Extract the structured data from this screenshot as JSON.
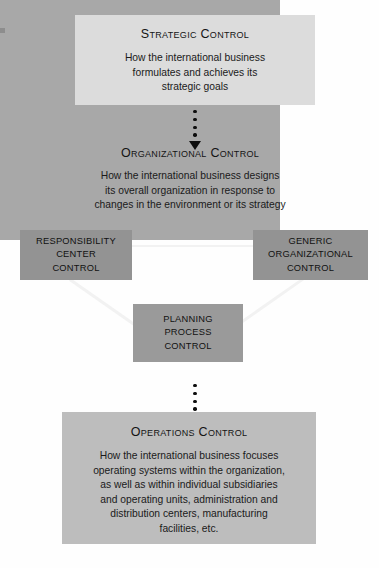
{
  "diagram": {
    "palette": {
      "page_background": "#fefefe",
      "strategic_fill": "#dcdcdc",
      "organizational_fill": "#a8a8a8",
      "subbox_fill": "#939393",
      "planning_fill": "#9a9a9a",
      "operations_fill": "#bdbdbd",
      "connector_line": "#f2f2f2",
      "arrow_color": "#0d0d0d",
      "text_color": "#141414"
    },
    "strategic": {
      "title": "Strategic Control",
      "body_lines": [
        "How the international business",
        "formulates and achieves its",
        "strategic goals"
      ]
    },
    "organizational": {
      "title": "Organizational Control",
      "body_lines": [
        "How the international business designs",
        "its overall organization in response to",
        "changes in the environment or its strategy"
      ],
      "subboxes": [
        {
          "id": "responsibility-center-control",
          "lines": [
            "RESPONSIBILITY",
            "CENTER",
            "CONTROL"
          ]
        },
        {
          "id": "generic-organizational-control",
          "lines": [
            "GENERIC",
            "ORGANIZATIONAL",
            "CONTROL"
          ]
        },
        {
          "id": "planning-process-control",
          "lines": [
            "PLANNING",
            "PROCESS",
            "CONTROL"
          ]
        }
      ]
    },
    "operations": {
      "title": "Operations Control",
      "body_lines": [
        "How the international business focuses",
        "operating systems within the organization,",
        "as well as within individual subsidiaries",
        "and operating units, administration and",
        "distribution centers, manufacturing",
        "facilities, etc."
      ]
    },
    "arrows": [
      {
        "id": "strategic-to-organizational",
        "style": "dotted-down-arrow",
        "dots": 4
      },
      {
        "id": "organizational-to-operations",
        "style": "dotted-down-arrow",
        "dots": 4
      }
    ],
    "connectors": [
      {
        "id": "responsibility-to-generic",
        "style": "horizontal-white-line"
      },
      {
        "id": "responsibility-to-planning",
        "style": "diagonal-white-line"
      },
      {
        "id": "generic-to-planning",
        "style": "diagonal-white-line"
      }
    ]
  }
}
